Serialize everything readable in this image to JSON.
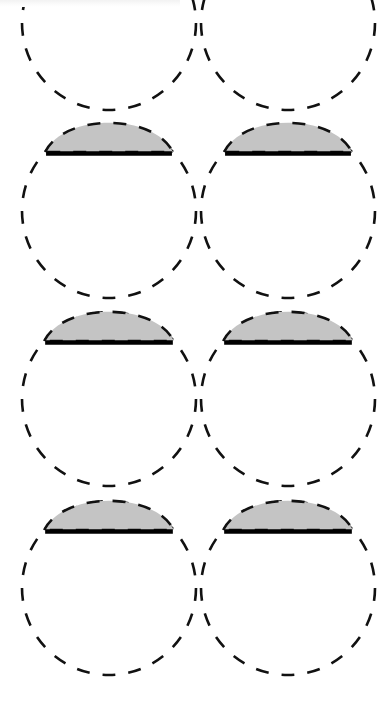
{
  "figure": {
    "background_color": "#ffffff",
    "canvas": {
      "width": 377,
      "height": 704
    }
  },
  "style": {
    "dash_stroke_color": "#111111",
    "dash_stroke_width": 2.6,
    "dash_length": 13,
    "dash_gap": 13,
    "cap_fill_color": "#c4c4c4",
    "cap_outline_color": "#111111",
    "chord_line_color": "#000000",
    "chord_line_width": 4.5
  },
  "geometry": {
    "circle_radius": 87,
    "cap_chord_offset_from_top": 30,
    "cap_flatten_ratio": 0.62,
    "column_centers_x": [
      109,
      288
    ],
    "row_centers_y": [
      211,
      399,
      588
    ],
    "partial_row_center_y": 23
  },
  "chart_data": {
    "type": "scatter",
    "xlabel": "",
    "ylabel": "",
    "grid": false,
    "legend_position": "none",
    "columns": 2,
    "rows": 3,
    "circles": [
      {
        "id": "circle-r1c1",
        "cx": 109,
        "cy": 211,
        "r": 87,
        "cap": true,
        "cap_chord_y": 152,
        "cap_top_y": 123,
        "partial": false,
        "label": ""
      },
      {
        "id": "circle-r1c2",
        "cx": 288,
        "cy": 211,
        "r": 87,
        "cap": true,
        "cap_chord_y": 152,
        "cap_top_y": 123,
        "partial": false,
        "label": ""
      },
      {
        "id": "circle-r2c1",
        "cx": 109,
        "cy": 399,
        "r": 87,
        "cap": true,
        "cap_chord_y": 341,
        "cap_top_y": 312,
        "partial": false,
        "label": ""
      },
      {
        "id": "circle-r2c2",
        "cx": 288,
        "cy": 399,
        "r": 87,
        "cap": true,
        "cap_chord_y": 341,
        "cap_top_y": 312,
        "partial": false,
        "label": ""
      },
      {
        "id": "circle-r3c1",
        "cx": 109,
        "cy": 588,
        "r": 87,
        "cap": true,
        "cap_chord_y": 530,
        "cap_top_y": 501,
        "partial": false,
        "label": ""
      },
      {
        "id": "circle-r3c2",
        "cx": 288,
        "cy": 588,
        "r": 87,
        "cap": true,
        "cap_chord_y": 530,
        "cap_top_y": 501,
        "partial": false,
        "label": ""
      },
      {
        "id": "circle-r0c1",
        "cx": 109,
        "cy": 23,
        "r": 87,
        "cap": false,
        "cap_chord_y": 0,
        "cap_top_y": 0,
        "partial": true,
        "label": ""
      },
      {
        "id": "circle-r0c2",
        "cx": 288,
        "cy": 23,
        "r": 87,
        "cap": false,
        "cap_chord_y": 0,
        "cap_top_y": 0,
        "partial": true,
        "label": ""
      }
    ],
    "annotations": []
  }
}
